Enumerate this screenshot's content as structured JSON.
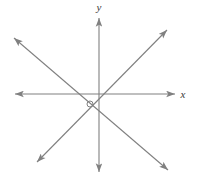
{
  "figure": {
    "background_color": "#ffffff",
    "stroke_color": "#808080",
    "label_color": "#3a3a3a"
  },
  "axes": {
    "x_axis": {
      "label": "x",
      "label_position": {
        "x": 183,
        "y": 98
      },
      "start": {
        "x": 15,
        "y": 94
      },
      "end": {
        "x": 175,
        "y": 94
      },
      "arrow_start": true,
      "arrow_end": true
    },
    "y_axis": {
      "label": "y",
      "label_position": {
        "x": 99,
        "y": 11
      },
      "start": {
        "x": 99,
        "y": 18
      },
      "end": {
        "x": 99,
        "y": 172
      },
      "arrow_start": true,
      "arrow_end": true
    }
  },
  "lines": [
    {
      "name": "line-negative-slope",
      "from": {
        "x": 14,
        "y": 38
      },
      "to": {
        "x": 168,
        "y": 170
      },
      "arrow_start": true,
      "arrow_end": true
    },
    {
      "name": "line-positive-slope",
      "from": {
        "x": 37,
        "y": 162
      },
      "to": {
        "x": 167,
        "y": 30
      },
      "arrow_start": true,
      "arrow_end": true
    }
  ],
  "markers": [
    {
      "name": "angle-marker",
      "shape": "circle",
      "center": {
        "x": 90,
        "y": 104
      },
      "radius": 3
    }
  ],
  "intersection": {
    "x": 92,
    "y": 107
  }
}
